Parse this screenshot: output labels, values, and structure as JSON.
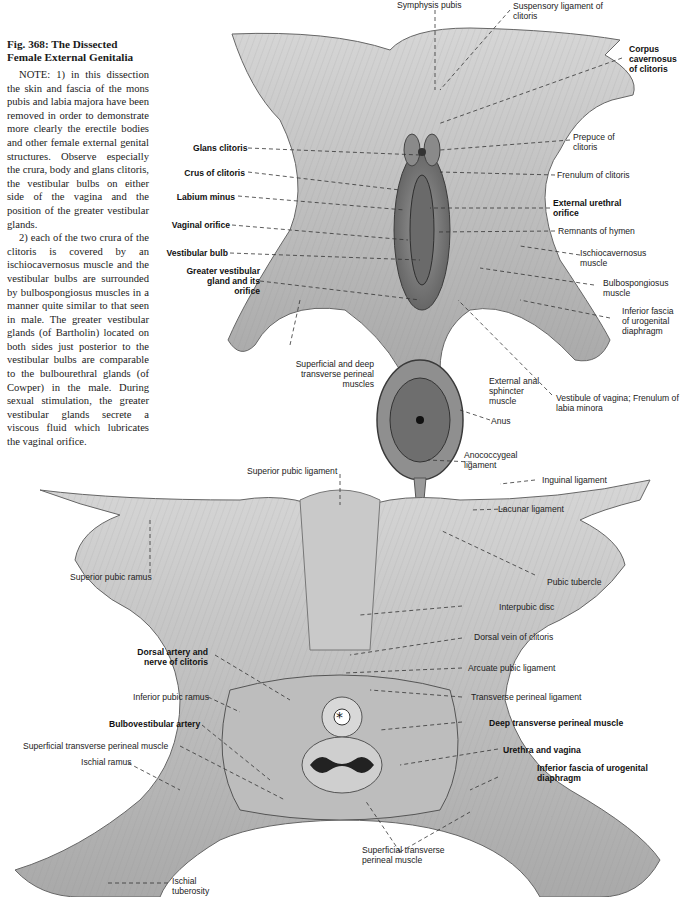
{
  "caption": {
    "title": "Fig. 368: The Dissected Female External Genitalia",
    "paragraphs": [
      "NOTE: 1) in this dissection the skin and fascia of the mons pubis and labia majora have been removed in order to demonstrate more clearly the erectile bodies and other female external genital structures. Observe especially the crura, body and glans clitoris, the vestibular bulbs on either side of the vagina and the position of the greater vestibular glands.",
      "2) each of the two crura of the clitoris is covered by an ischiocavernosus muscle and the vestibular bulbs are surrounded by bulbospongiosus muscles in a manner quite similar to that seen in male. The greater vestibular glands (of Bartholin) located on both sides just posterior to the vestibular bulbs are comparable to the bulbourethral glands (of Cowper) in the male. During sexual stimulation, the greater vestibular glands secrete a viscous fluid which lubricates the vaginal orifice."
    ]
  },
  "upper_figure": {
    "labels": {
      "symphysis_pubis": "Symphysis pubis",
      "suspensory_ligament": "Suspensory ligament of clitoris",
      "corpus_cavernosus": "Corpus cavernosus of clitoris",
      "prepuce": "Prepuce of clitoris",
      "glans_clitoris": "Glans clitoris",
      "frenulum_clitoris": "Frenulum of clitoris",
      "crus_clitoris": "Crus of clitoris",
      "labium_minus": "Labium minus",
      "external_urethral_orifice": "External urethral orifice",
      "vaginal_orifice": "Vaginal orifice",
      "remnants_hymen": "Remnants of hymen",
      "vestibular_bulb": "Vestibular bulb",
      "ischiocavernosus": "Ischiocavernosus muscle",
      "greater_vestibular_gland": "Greater vestibular gland and its orifice",
      "bulbospongiosus": "Bulbospongiosus muscle",
      "inferior_fascia": "Inferior fascia of urogenital diaphragm",
      "transverse_perineal": "Superficial and deep transverse perineal muscles",
      "external_anal_sphincter": "External anal sphincter muscle",
      "vestibule_vagina": "Vestibule of vagina; Frenulum of labia minora",
      "anus": "Anus",
      "anococcygeal": "Anococcygeal ligament"
    }
  },
  "lower_figure": {
    "labels": {
      "superior_pubic_ligament": "Superior pubic ligament",
      "inguinal_ligament": "Inguinal ligament",
      "lacunar_ligament": "Lacunar ligament",
      "superior_pubic_ramus": "Superior pubic ramus",
      "pubic_tubercle": "Pubic tubercle",
      "interpubic_disc": "Interpubic disc",
      "dorsal_artery_nerve": "Dorsal artery and nerve of clitoris",
      "dorsal_vein": "Dorsal vein of clitoris",
      "arcuate_pubic_ligament": "Arcuate pubic ligament",
      "inferior_pubic_ramus": "Inferior pubic ramus",
      "transverse_perineal_ligament": "Transverse perineal ligament",
      "bulbovestibular_artery": "Bulbovestibular artery",
      "deep_transverse_perineal": "Deep transverse perineal muscle",
      "superficial_transverse_perineal_left": "Superficial transverse perineal muscle",
      "urethra_vagina": "Urethra and vagina",
      "ischial_ramus": "Ischial ramus",
      "inferior_fascia_urogenital": "Inferior fascia of urogenital diaphragm",
      "superficial_transverse_perineal_bottom": "Superficial transverse perineal muscle",
      "ischial_tuberosity": "Ischial tuberosity"
    }
  }
}
